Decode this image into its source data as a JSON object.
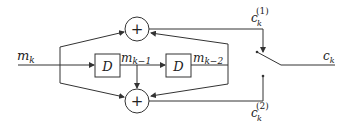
{
  "diagram": {
    "input_label": "m",
    "input_sub": "k",
    "delay1_label": "D",
    "delay2_label": "D",
    "delay1_out": "m",
    "delay1_out_sub": "k−1",
    "delay2_out": "m",
    "delay2_out_sub": "k−2",
    "adder_top_symbol": "+",
    "adder_bottom_symbol": "+",
    "out_top": "c",
    "out_top_sub": "k",
    "out_top_sup": "(1)",
    "out_bottom": "c",
    "out_bottom_sub": "k",
    "out_bottom_sup": "(2)",
    "output": "c",
    "output_sub": "k",
    "line_color": "#333333"
  }
}
